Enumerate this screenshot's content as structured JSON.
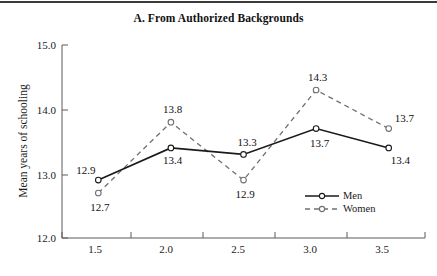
{
  "chart_data": {
    "type": "line",
    "title": "A. From Authorized Backgrounds",
    "xlabel": "",
    "ylabel": "Mean years of schooling",
    "x": [
      1.5,
      2.0,
      2.5,
      3.0,
      3.5
    ],
    "xtick_labels": [
      "1.5",
      "2.0",
      "2.5",
      "3.0",
      "3.5"
    ],
    "ytick_labels": [
      "12.0",
      "13.0",
      "14.0",
      "15.0"
    ],
    "ylim": [
      12.0,
      15.0
    ],
    "xlim": [
      1.25,
      3.75
    ],
    "grid": false,
    "legend_position": "bottom-right",
    "series": [
      {
        "name": "Men",
        "style": "solid",
        "marker": "open-circle",
        "color": "#1a1a1a",
        "values": [
          12.9,
          13.4,
          13.3,
          13.7,
          13.4
        ],
        "labels": [
          "12.9",
          "13.4",
          "13.3",
          "13.7",
          "13.4"
        ]
      },
      {
        "name": "Women",
        "style": "dashed",
        "marker": "open-circle",
        "color": "#707070",
        "values": [
          12.7,
          13.8,
          12.9,
          14.3,
          13.7
        ],
        "labels": [
          "12.7",
          "13.8",
          "12.9",
          "14.3",
          "13.7"
        ]
      }
    ]
  },
  "title": {
    "text": "A. From Authorized Backgrounds"
  },
  "axes": {
    "y_title": "Mean years of schooling",
    "y_ticks": [
      "15.0",
      "14.0",
      "13.0",
      "12.0"
    ],
    "x_ticks": [
      "1.5",
      "2.0",
      "2.5",
      "3.0",
      "3.5"
    ]
  },
  "legend": {
    "men": "Men",
    "women": "Women"
  },
  "point_labels": {
    "men": [
      "12.9",
      "13.4",
      "13.3",
      "13.7",
      "13.4"
    ],
    "women": [
      "12.7",
      "13.8",
      "12.9",
      "14.3",
      "13.7"
    ]
  }
}
